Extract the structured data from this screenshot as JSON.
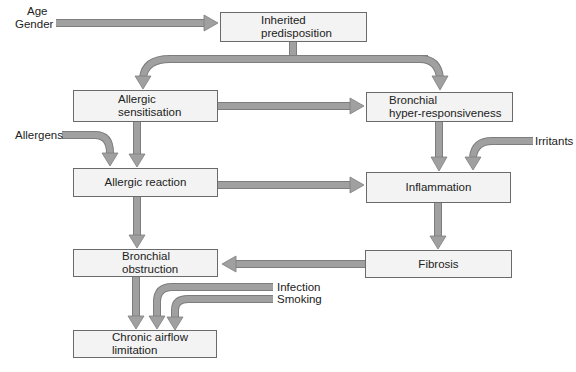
{
  "diagram": {
    "title": "",
    "colors": {
      "box_fill": "#f3f3f3",
      "box_border": "#6a6a6a",
      "arrow": "#a0a0a0",
      "arrow_edge": "#7a7a7a"
    },
    "nodes": {
      "inherited": {
        "line1": "Inherited",
        "line2": "predisposition"
      },
      "sensitisation": {
        "line1": "Allergic",
        "line2": "sensitisation"
      },
      "hyperresponsiveness": {
        "line1": "Bronchial",
        "line2": "hyper-responsiveness"
      },
      "reaction": {
        "line1": "Allergic reaction"
      },
      "inflammation": {
        "line1": "Inflammation"
      },
      "obstruction": {
        "line1": "Bronchial",
        "line2": "obstruction"
      },
      "fibrosis": {
        "line1": "Fibrosis"
      },
      "chronic": {
        "line1": "Chronic airflow",
        "line2": "limitation"
      }
    },
    "external_factors": {
      "age": "Age",
      "gender": "Gender",
      "allergens": "Allergens",
      "irritants": "Irritants",
      "infection": "Infection",
      "smoking": "Smoking"
    },
    "edges": [
      {
        "from": "Age/Gender",
        "to": "Inherited predisposition"
      },
      {
        "from": "Inherited predisposition",
        "to": "Allergic sensitisation"
      },
      {
        "from": "Inherited predisposition",
        "to": "Bronchial hyper-responsiveness"
      },
      {
        "from": "Allergic sensitisation",
        "to": "Bronchial hyper-responsiveness"
      },
      {
        "from": "Allergic sensitisation",
        "to": "Allergic reaction"
      },
      {
        "from": "Allergens",
        "to": "Allergic reaction"
      },
      {
        "from": "Bronchial hyper-responsiveness",
        "to": "Inflammation"
      },
      {
        "from": "Irritants",
        "to": "Inflammation"
      },
      {
        "from": "Allergic reaction",
        "to": "Inflammation"
      },
      {
        "from": "Allergic reaction",
        "to": "Bronchial obstruction"
      },
      {
        "from": "Inflammation",
        "to": "Fibrosis"
      },
      {
        "from": "Fibrosis",
        "to": "Bronchial obstruction"
      },
      {
        "from": "Bronchial obstruction",
        "to": "Chronic airflow limitation"
      },
      {
        "from": "Infection",
        "to": "Chronic airflow limitation"
      },
      {
        "from": "Smoking",
        "to": "Chronic airflow limitation"
      }
    ]
  }
}
